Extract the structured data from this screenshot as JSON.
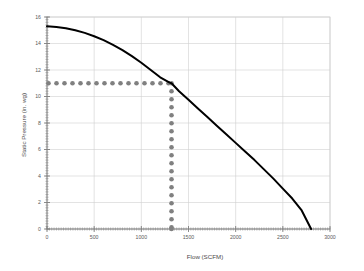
{
  "chart_data": {
    "type": "line",
    "title": "",
    "xlabel": "Flow (SCFM)",
    "ylabel": "Static Pressure (in. wg)",
    "xlim": [
      0,
      3000
    ],
    "ylim": [
      0,
      16
    ],
    "xticks": [
      0,
      500,
      1000,
      1500,
      2000,
      2500,
      3000
    ],
    "yticks": [
      0,
      2,
      4,
      6,
      8,
      10,
      12,
      14,
      16
    ],
    "xtick_labels": [
      "0",
      "500",
      "1000",
      "1500",
      "2000",
      "2500",
      "3000"
    ],
    "ytick_labels": [
      "0",
      "2",
      "4",
      "6",
      "8",
      "10",
      "12",
      "14",
      "16"
    ],
    "grid": true,
    "legend": "none",
    "series": [
      {
        "name": "Fan curve",
        "type": "line",
        "color": "#000000",
        "linewidth": 2.0,
        "linestyle": "solid",
        "x": [
          0,
          100,
          200,
          300,
          400,
          500,
          600,
          700,
          800,
          900,
          1000,
          1100,
          1200,
          1300,
          1320,
          1400,
          1500,
          1600,
          1700,
          1800,
          1900,
          2000,
          2100,
          2200,
          2300,
          2400,
          2500,
          2600,
          2700,
          2800
        ],
        "y": [
          15.3,
          15.25,
          15.15,
          15.0,
          14.8,
          14.55,
          14.25,
          13.9,
          13.5,
          13.05,
          12.55,
          12.0,
          11.45,
          11.05,
          11.0,
          10.4,
          9.75,
          9.1,
          8.45,
          7.8,
          7.15,
          6.5,
          5.85,
          5.2,
          4.5,
          3.8,
          3.05,
          2.3,
          1.4,
          0.0
        ]
      },
      {
        "name": "Operating point pressure guide",
        "type": "dotted-horizontal",
        "color": "#808080",
        "y_value": 11.0,
        "x_from": 0,
        "x_to": 1320
      },
      {
        "name": "Operating point flow guide",
        "type": "dotted-vertical",
        "color": "#808080",
        "x_value": 1320,
        "y_from": 0,
        "y_to": 11.0
      }
    ],
    "annotations": [
      {
        "name": "operating-point",
        "x": 1320,
        "y": 11.0,
        "label": ""
      }
    ]
  },
  "colors": {
    "curve": "#000000",
    "guide_dots": "#808080",
    "grid": "#d0d0d0",
    "axis": "#808080",
    "background": "#ffffff",
    "text": "#5a5a5a"
  }
}
